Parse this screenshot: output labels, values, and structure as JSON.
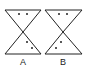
{
  "figures": [
    {
      "label": "A",
      "description": "hourglass with two dots in top and two dots in bottom-right"
    },
    {
      "label": "B",
      "description": "hourglass with two dots in top and two dots in bottom-left"
    }
  ],
  "colors": {
    "stroke": "#222222",
    "background": "#ffffff"
  }
}
